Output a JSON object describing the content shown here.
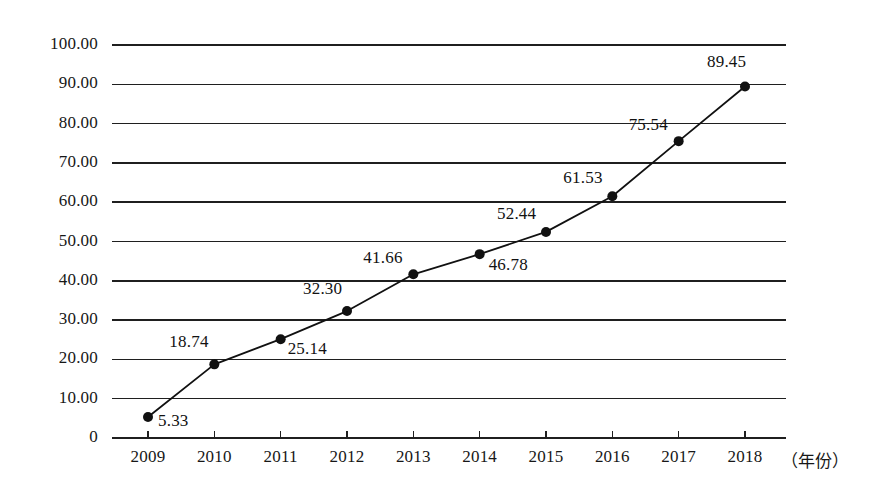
{
  "chart_data": {
    "type": "line",
    "title": "",
    "subtitle": "",
    "xlabel": "（年份）",
    "ylabel": "",
    "categories": [
      "2009",
      "2010",
      "2011",
      "2012",
      "2013",
      "2014",
      "2015",
      "2016",
      "2017",
      "2018"
    ],
    "x": [
      2009,
      2010,
      2011,
      2012,
      2013,
      2014,
      2015,
      2016,
      2017,
      2018
    ],
    "values": [
      5.33,
      18.74,
      25.14,
      32.3,
      41.66,
      46.78,
      52.44,
      61.53,
      75.54,
      89.45
    ],
    "point_labels": [
      "5.33",
      "18.74",
      "25.14",
      "32.30",
      "41.66",
      "46.78",
      "52.44",
      "61.53",
      "75.54",
      "89.45"
    ],
    "ylim": [
      0,
      100
    ],
    "xlim": [
      2008.6,
      2018.6
    ],
    "ytick_labels": [
      "100.00",
      "90.00",
      "80.00",
      "70.00",
      "60.00",
      "50.00",
      "40.00",
      "30.00",
      "20.00",
      "10.00",
      "0"
    ],
    "ytick_values": [
      100,
      90,
      80,
      70,
      60,
      50,
      40,
      30,
      20,
      10,
      0
    ],
    "grid": "horizontal",
    "legend": "none",
    "series_color": "#111111",
    "gridline_color": "#1f1f1f",
    "marker": "filled-circle",
    "marker_size": 10,
    "label_offsets": [
      {
        "value": "5.33",
        "dx": 10,
        "dy": 4
      },
      {
        "value": "18.74",
        "dx": -45,
        "dy": -22
      },
      {
        "value": "25.14",
        "dx": 7,
        "dy": 10
      },
      {
        "value": "32.30",
        "dx": -44,
        "dy": -22
      },
      {
        "value": "41.66",
        "dx": -50,
        "dy": -16
      },
      {
        "value": "46.78",
        "dx": 9,
        "dy": 11
      },
      {
        "value": "52.44",
        "dx": -49,
        "dy": -18
      },
      {
        "value": "61.53",
        "dx": -49,
        "dy": -18
      },
      {
        "value": "75.54",
        "dx": -50,
        "dy": -16
      },
      {
        "value": "89.45",
        "dx": -38,
        "dy": -24
      }
    ]
  }
}
